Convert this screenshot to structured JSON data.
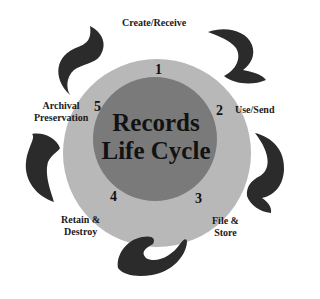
{
  "diagram": {
    "title_line1": "Records",
    "title_line2": "Life Cycle",
    "colors": {
      "background": "#ffffff",
      "outer_ring": "#b8b8b8",
      "inner_circle": "#7a7a7a",
      "arrows": "#2b2b2b",
      "text": "#1a1a1a"
    },
    "stages": [
      {
        "number": "1",
        "label": "Create/Receive"
      },
      {
        "number": "2",
        "label": "Use/Send"
      },
      {
        "number": "3",
        "label_line1": "File &",
        "label_line2": "Store"
      },
      {
        "number": "4",
        "label_line1": "Retain &",
        "label_line2": "Destroy"
      },
      {
        "number": "5",
        "label_line1": "Archival",
        "label_line2": "Preservation"
      }
    ],
    "arrows": [
      "curved-arrow-top-left",
      "curved-arrow-top-right",
      "curved-arrow-right",
      "curved-arrow-bottom",
      "curved-arrow-left"
    ]
  }
}
